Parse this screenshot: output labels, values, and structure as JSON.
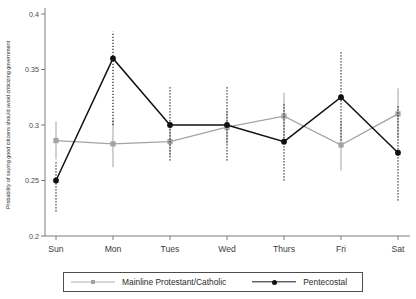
{
  "chart_data": {
    "type": "line",
    "title": "",
    "xlabel": "",
    "ylabel": "Probability of saying good citizens should avoid criticizing government",
    "categories": [
      "Sun",
      "Mon",
      "Tues",
      "Wed",
      "Thurs",
      "Fri",
      "Sat"
    ],
    "ylim": [
      0.2,
      0.4
    ],
    "yticks": [
      0.2,
      0.25,
      0.3,
      0.35,
      0.4
    ],
    "ytick_labels": [
      "0.2",
      "0.25",
      "0.3",
      "0.35",
      "0.4"
    ],
    "grid": false,
    "legend_position": "bottom",
    "series": [
      {
        "name": "Mainline Protestant/Catholic",
        "color": "#a3a3a3",
        "marker": "square",
        "line_style": "solid",
        "errorbar_style": "solid",
        "values": [
          0.286,
          0.283,
          0.285,
          0.298,
          0.308,
          0.282,
          0.31
        ],
        "ci_low": [
          0.269,
          0.262,
          0.272,
          0.283,
          0.288,
          0.259,
          0.288
        ],
        "ci_high": [
          0.303,
          0.305,
          0.299,
          0.313,
          0.329,
          0.304,
          0.333
        ]
      },
      {
        "name": "Pentecostal",
        "color": "#111111",
        "marker": "circle",
        "line_style": "solid",
        "errorbar_style": "dotted",
        "values": [
          0.25,
          0.36,
          0.3,
          0.3,
          0.285,
          0.325,
          0.275
        ],
        "ci_low": [
          0.222,
          0.3,
          0.268,
          0.268,
          0.25,
          0.286,
          0.232
        ],
        "ci_high": [
          0.268,
          0.384,
          0.335,
          0.334,
          0.32,
          0.366,
          0.318
        ]
      }
    ]
  },
  "legend": {
    "entries": [
      {
        "label": "Mainline Protestant/Catholic"
      },
      {
        "label": "Pentecostal"
      }
    ]
  },
  "axis": {
    "y_title": "Probability of saying good citizens should avoid criticizing government"
  }
}
